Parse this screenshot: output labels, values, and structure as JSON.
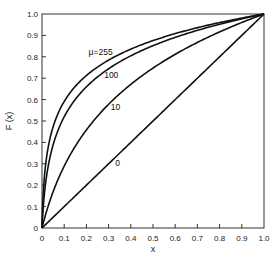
{
  "chart_data": {
    "type": "line",
    "title": "",
    "xlabel": "x",
    "ylabel": "F (x)",
    "xlim": [
      0,
      1.0
    ],
    "ylim": [
      0,
      1.0
    ],
    "grid": false,
    "legend": "inline curve labels",
    "x_ticks": [
      "0",
      "0.1",
      "0.2",
      "0.3",
      "0.4",
      "0.5",
      "0.6",
      "0.7",
      "0.8",
      "0.9",
      "1.0"
    ],
    "y_ticks": [
      "0",
      "0.1",
      "0.2",
      "0.3",
      "0.4",
      "0.5",
      "0.6",
      "0.7",
      "0.8",
      "0.9",
      "1.0"
    ],
    "x": [
      0,
      0.005,
      0.01,
      0.02,
      0.03,
      0.05,
      0.075,
      0.1,
      0.15,
      0.2,
      0.3,
      0.4,
      0.5,
      0.6,
      0.7,
      0.8,
      0.9,
      1.0
    ],
    "series": [
      {
        "name": "μ=255",
        "label": "μ=255",
        "mu": 255,
        "values": [
          0,
          0.15,
          0.23,
          0.33,
          0.39,
          0.47,
          0.54,
          0.59,
          0.66,
          0.71,
          0.78,
          0.83,
          0.88,
          0.91,
          0.94,
          0.96,
          0.98,
          1.0
        ]
      },
      {
        "name": "100",
        "label": "100",
        "mu": 100,
        "values": [
          0,
          0.09,
          0.15,
          0.23,
          0.3,
          0.39,
          0.46,
          0.52,
          0.6,
          0.66,
          0.74,
          0.8,
          0.85,
          0.89,
          0.93,
          0.95,
          0.98,
          1.0
        ]
      },
      {
        "name": "10",
        "label": "10",
        "mu": 10,
        "values": [
          0,
          0.02,
          0.04,
          0.08,
          0.11,
          0.17,
          0.23,
          0.29,
          0.38,
          0.46,
          0.57,
          0.66,
          0.75,
          0.82,
          0.88,
          0.94,
          0.97,
          1.0
        ]
      },
      {
        "name": "0",
        "label": "0",
        "mu": 0,
        "values": [
          0,
          0.005,
          0.01,
          0.02,
          0.03,
          0.05,
          0.075,
          0.1,
          0.15,
          0.2,
          0.3,
          0.4,
          0.5,
          0.6,
          0.7,
          0.8,
          0.9,
          1.0
        ]
      }
    ],
    "annotations": [
      {
        "text": "μ=255",
        "x": 0.21,
        "y": 0.81
      },
      {
        "text": "100",
        "x": 0.28,
        "y": 0.7
      },
      {
        "text": "10",
        "x": 0.31,
        "y": 0.55
      },
      {
        "text": "0",
        "x": 0.33,
        "y": 0.29
      }
    ],
    "line_color": "#111111"
  }
}
